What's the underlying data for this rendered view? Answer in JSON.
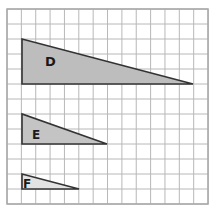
{
  "grid": {
    "x0": 7,
    "y0": 9,
    "cols": 14,
    "rows": 13,
    "cell_w": 14.36,
    "cell_h": 15,
    "line_color": "#b8b8b8",
    "border_color": "#a8a8a8"
  },
  "triangles": [
    {
      "label": "D",
      "points": "22,39 22,84 193,84",
      "fill": "#bdbdbd",
      "label_x": 45,
      "label_y": 66,
      "font_size": 13
    },
    {
      "label": "E",
      "points": "22,114 22,144 107,144",
      "fill": "#c4c4c4",
      "label_x": 32,
      "label_y": 139,
      "font_size": 12
    },
    {
      "label": "F",
      "points": "22,174 22,189 79,189",
      "fill": "#e3e3e3",
      "label_x": 23,
      "label_y": 188,
      "font_size": 12
    }
  ],
  "colors": {
    "stroke": "#333333",
    "label": "#1a1a1a"
  }
}
